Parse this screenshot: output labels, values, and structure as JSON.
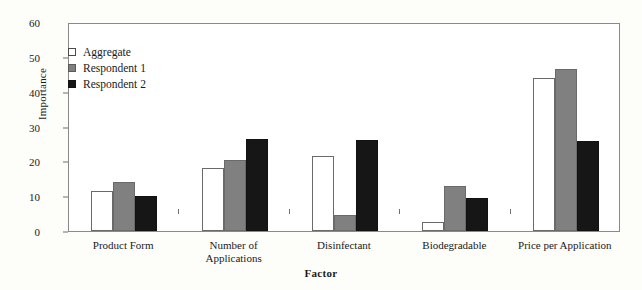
{
  "chart_data": {
    "type": "bar",
    "title": "",
    "xlabel": "Factor",
    "ylabel": "Importance",
    "ylim": [
      0,
      60
    ],
    "yticks": [
      0,
      10,
      20,
      30,
      40,
      50,
      60
    ],
    "grid": false,
    "legend_position": "top-left",
    "categories": [
      "Product Form",
      "Number of\nApplications",
      "Disinfectant",
      "Biodegradable",
      "Price per Application"
    ],
    "series": [
      {
        "name": "Aggregate",
        "color": "#ffffff",
        "values": [
          11.5,
          18.0,
          21.5,
          2.5,
          44.0
        ]
      },
      {
        "name": "Respondent 1",
        "color": "#808080",
        "values": [
          14.0,
          20.3,
          4.5,
          12.8,
          46.5
        ]
      },
      {
        "name": "Respondent 2",
        "color": "#161616",
        "values": [
          10.0,
          26.3,
          26.0,
          9.5,
          25.8
        ]
      }
    ]
  },
  "legend": {
    "items": [
      {
        "label": "Aggregate",
        "swatch": "aggregate"
      },
      {
        "label": "Respondent 1",
        "swatch": "resp1"
      },
      {
        "label": "Respondent 2",
        "swatch": "resp2"
      }
    ]
  },
  "colors": {
    "background": "#fdfdfa",
    "plot_background": "#ffffff",
    "axis": "#8a8a8a",
    "aggregate": "#ffffff",
    "respondent1": "#808080",
    "respondent2": "#161616"
  }
}
